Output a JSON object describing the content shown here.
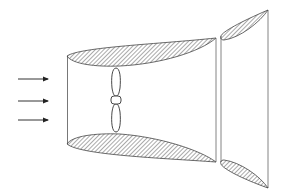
{
  "diagram": {
    "title": "Ducted propeller with diffuser (wind turbine shroud)",
    "colors": {
      "stroke": "#333333",
      "hatch": "#555555",
      "background": "#ffffff"
    },
    "elements": {
      "inflow_arrows": {
        "count": 3,
        "direction": "right",
        "y": [
          79,
          101,
          120
        ]
      },
      "main_duct": {
        "shape": "shroud with airfoil cross-section",
        "hatched": true
      },
      "propeller": {
        "blades": 2,
        "orientation": "vertical"
      },
      "diffuser_ring": {
        "shape": "flanged diffuser with airfoil cross-section",
        "hatched": true
      }
    }
  }
}
